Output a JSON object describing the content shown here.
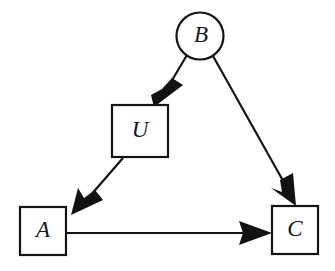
{
  "diagram": {
    "type": "directed-acyclic-graph",
    "background_color": "#ffffff",
    "stroke_color": "#141414",
    "arrow_fill_color": "#121212",
    "nodes": [
      {
        "id": "B",
        "label": "B",
        "shape": "circle",
        "cx": 200,
        "cy": 36,
        "r": 23.5
      },
      {
        "id": "U",
        "label": "U",
        "shape": "rect",
        "x": 112,
        "y": 105,
        "width": 56,
        "height": 52
      },
      {
        "id": "A",
        "label": "A",
        "shape": "rect",
        "x": 20,
        "y": 207,
        "width": 46,
        "height": 48
      },
      {
        "id": "C",
        "label": "C",
        "shape": "rect",
        "x": 272,
        "y": 206,
        "width": 46,
        "height": 48
      }
    ],
    "edges": [
      {
        "id": "B-to-U",
        "from": "B",
        "to": "U",
        "x1": 186,
        "y1": 56,
        "x2": 157,
        "y2": 104,
        "directed": true
      },
      {
        "id": "B-to-C",
        "from": "B",
        "to": "C",
        "x1": 213,
        "y1": 57,
        "x2": 295,
        "y2": 204,
        "directed": true
      },
      {
        "id": "U-to-A",
        "from": "U",
        "to": "A",
        "x1": 122,
        "y1": 159,
        "x2": 73,
        "y2": 213,
        "directed": true
      },
      {
        "id": "A-to-C",
        "from": "A",
        "to": "C",
        "x1": 66,
        "y1": 233,
        "x2": 271,
        "y2": 233,
        "directed": true
      }
    ]
  }
}
